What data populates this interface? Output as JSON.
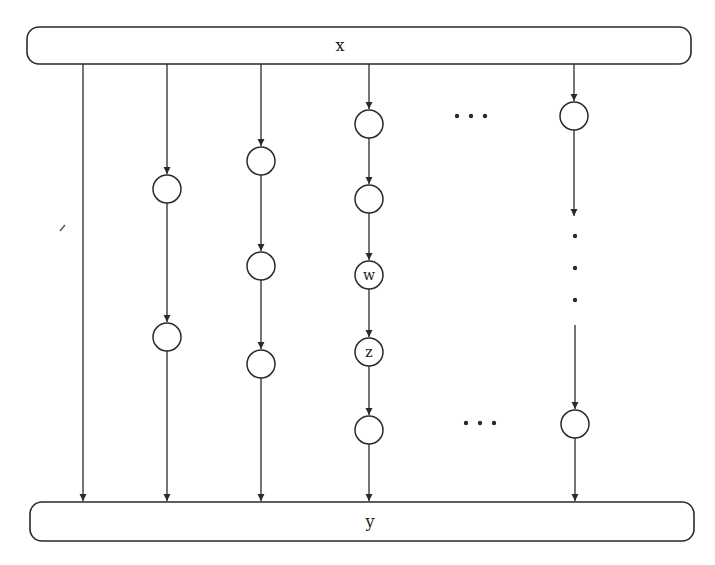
{
  "diagram": {
    "type": "parallel-paths DAG",
    "source": {
      "label": "x",
      "box": {
        "x": 27,
        "y": 27,
        "w": 664,
        "h": 37,
        "rx": 12
      },
      "label_pos": [
        340,
        51
      ]
    },
    "sink": {
      "label": "y",
      "box": {
        "x": 30,
        "y": 502,
        "w": 664,
        "h": 39,
        "rx": 12
      },
      "label_pos": [
        370,
        527
      ]
    },
    "node_radius": 14,
    "columns": [
      {
        "x": 83,
        "nodes": []
      },
      {
        "x": 167,
        "nodes": [
          {
            "y": 189,
            "label": ""
          },
          {
            "y": 337,
            "label": ""
          }
        ]
      },
      {
        "x": 261,
        "nodes": [
          {
            "y": 161,
            "label": ""
          },
          {
            "y": 266,
            "label": ""
          },
          {
            "y": 364,
            "label": ""
          }
        ]
      },
      {
        "x": 369,
        "nodes": [
          {
            "y": 124,
            "label": ""
          },
          {
            "y": 199,
            "label": ""
          },
          {
            "y": 275,
            "label": "w"
          },
          {
            "y": 352,
            "label": "z"
          },
          {
            "y": 430,
            "label": ""
          }
        ]
      },
      {
        "x": 574,
        "nodes": [
          {
            "y": 116,
            "label": ""
          },
          {
            "y": 424,
            "label": ""
          }
        ],
        "gap": {
          "from": 130,
          "to": 222,
          "resume": 325
        }
      }
    ],
    "ellipses": {
      "horizontal_top": {
        "x": [
          457,
          471,
          485
        ],
        "y": 116
      },
      "horizontal_bottom": {
        "x": [
          466,
          480,
          494
        ],
        "y": 423
      },
      "vertical": {
        "x": 575,
        "y": [
          236,
          268,
          300
        ]
      }
    },
    "labels": {
      "w": "w",
      "z": "z",
      "x": "x",
      "y": "y",
      "ellipsis": "…"
    }
  },
  "caption": {
    "text": ""
  }
}
